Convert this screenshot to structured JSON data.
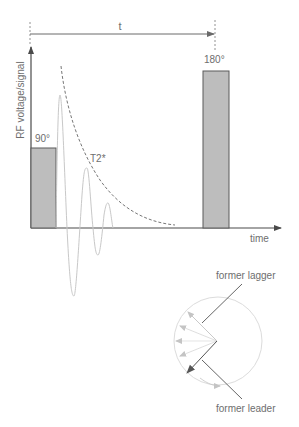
{
  "diagram": {
    "title": "",
    "labels": {
      "interval": "t",
      "pulse90": "90°",
      "pulse180": "180°",
      "y_axis": "RF voltage/signal",
      "x_axis": "time",
      "decay": "T2*",
      "lagger": "former lagger",
      "leader": "former leader"
    },
    "colors": {
      "pulse_fill": "#bdbdbd",
      "pulse_stroke": "#5a5a5a",
      "axis": "#4a4a4a",
      "fid": "#c8c8c8",
      "envelope": "#666666",
      "circle": "#dcdcdc",
      "spin_arrows": "#c4c4c4",
      "text": "#6e6e6e"
    }
  }
}
